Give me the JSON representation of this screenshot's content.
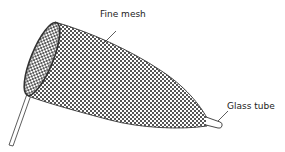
{
  "diagram": {
    "labels": {
      "mesh": "Fine mesh",
      "tube": "Glass tube"
    },
    "colors": {
      "outline": "#333333",
      "mesh_dark": "#555555",
      "mesh_light": "#ffffff",
      "background": "#ffffff"
    },
    "parts": [
      "handle",
      "rim",
      "fine-mesh-net",
      "glass-tube"
    ]
  }
}
